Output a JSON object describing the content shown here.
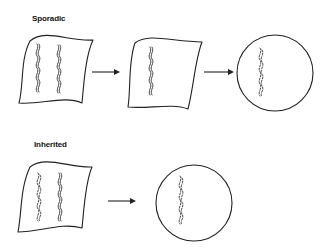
{
  "diagram": {
    "rows": [
      {
        "label": "Sporadic",
        "stages": [
          {
            "shape": "cell-sheet",
            "chromosomes": [
              "normal-pair",
              "normal-pair"
            ]
          },
          {
            "shape": "cell-sheet",
            "chromosomes": [
              "normal-pair"
            ]
          },
          {
            "shape": "circle",
            "chromosomes": [
              "fragmented"
            ]
          }
        ],
        "arrows": 2
      },
      {
        "label": "Inherited",
        "stages": [
          {
            "shape": "cell-sheet",
            "chromosomes": [
              "fragmented",
              "normal-pair"
            ]
          },
          {
            "shape": "circle",
            "chromosomes": [
              "fragmented"
            ]
          }
        ],
        "arrows": 1
      }
    ],
    "colors": {
      "stroke": "#222222",
      "background": "#ffffff"
    }
  }
}
